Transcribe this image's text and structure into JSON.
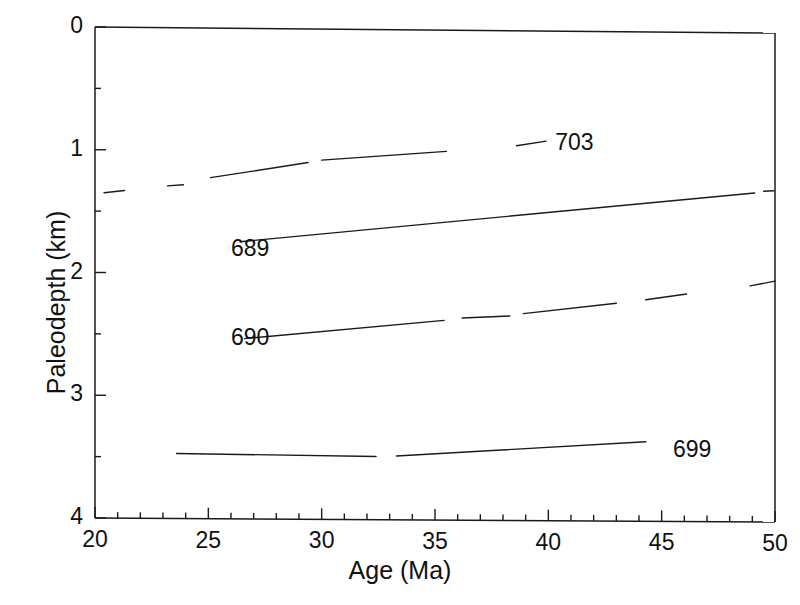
{
  "chart_data": {
    "type": "line",
    "title": "",
    "xlabel": "Age (Ma)",
    "ylabel": "Paleodepth (km)",
    "xlim": [
      20,
      50
    ],
    "ylim": [
      4,
      0
    ],
    "y_inverted": true,
    "grid": false,
    "legend": "inline-curve-labels",
    "xticks": [
      20,
      25,
      30,
      35,
      40,
      45,
      50
    ],
    "xtick_labels": [
      "20",
      "25",
      "30",
      "35",
      "40",
      "45",
      "50"
    ],
    "xminor_step": 1,
    "yticks": [
      0,
      1,
      2,
      3,
      4
    ],
    "ytick_labels": [
      "0",
      "1",
      "2",
      "3",
      "4"
    ],
    "yminor_step": 0.5,
    "series": [
      {
        "name": "703",
        "label": "703",
        "label_x": 40.3,
        "label_y": 0.93,
        "style": "dashed",
        "x": [
          20.4,
          21.3,
          23.2,
          23.9,
          25.1,
          26.1,
          28.3,
          29.4,
          32.8,
          34.3,
          35.5,
          38.6,
          39.9
        ],
        "y": [
          1.35,
          1.33,
          1.29,
          1.28,
          1.22,
          1.21,
          1.11,
          1.09,
          1.01,
          1.0,
          0.99,
          0.94,
          0.9
        ],
        "segments": [
          {
            "x": [
              20.4,
              21.3
            ],
            "y": [
              1.35,
              1.33
            ]
          },
          {
            "x": [
              23.2,
              23.9
            ],
            "y": [
              1.29,
              1.28
            ]
          },
          {
            "x": [
              25.1,
              29.4
            ],
            "y": [
              1.22,
              1.09
            ]
          },
          {
            "x": [
              30.0,
              35.5
            ],
            "y": [
              1.07,
              0.99
            ]
          },
          {
            "x": [
              38.6,
              39.9
            ],
            "y": [
              0.94,
              0.9
            ]
          }
        ]
      },
      {
        "name": "689",
        "label": "689",
        "label_x": 26.0,
        "label_y": 1.82,
        "style": "solid",
        "x": [
          26.4,
          28.0,
          30.0,
          32.0,
          34.0,
          36.0,
          38.0,
          40.0,
          42.0,
          44.0,
          46.0,
          48.0,
          49.1,
          49.9
        ],
        "y": [
          1.74,
          1.7,
          1.66,
          1.63,
          1.6,
          1.56,
          1.52,
          1.48,
          1.44,
          1.41,
          1.37,
          1.33,
          1.31,
          1.29
        ],
        "segments": [
          {
            "x": [
              26.4,
              49.1
            ],
            "y": [
              1.74,
              1.31
            ]
          },
          {
            "x": [
              49.5,
              49.95
            ],
            "y": [
              1.295,
              1.29
            ]
          }
        ]
      },
      {
        "name": "690",
        "label": "690",
        "label_x": 26.0,
        "label_y": 2.54,
        "style": "mixed",
        "x": [
          26.6,
          28.5,
          30.5,
          32.5,
          34.0,
          35.4,
          38.3,
          40.9,
          43.0,
          44.3,
          47.5,
          49.3,
          50.0
        ],
        "y": [
          2.53,
          2.49,
          2.45,
          2.42,
          2.4,
          2.37,
          2.33,
          2.27,
          2.22,
          2.19,
          2.12,
          2.06,
          2.03
        ],
        "segments": [
          {
            "x": [
              26.6,
              35.4
            ],
            "y": [
              2.53,
              2.37
            ]
          },
          {
            "x": [
              36.2,
              38.3
            ],
            "y": [
              2.35,
              2.33
            ]
          },
          {
            "x": [
              38.9,
              43.0
            ],
            "y": [
              2.31,
              2.22
            ]
          },
          {
            "x": [
              44.3,
              46.1
            ],
            "y": [
              2.19,
              2.14
            ]
          },
          {
            "x": [
              48.9,
              50.0
            ],
            "y": [
              2.07,
              2.03
            ]
          }
        ]
      },
      {
        "name": "699",
        "label": "699",
        "label_x": 45.5,
        "label_y": 3.43,
        "style": "solid",
        "x": [
          23.6,
          25.0,
          27.0,
          29.0,
          31.0,
          33.0,
          35.0,
          37.0,
          39.0,
          41.0,
          43.0,
          44.3
        ],
        "y": [
          3.47,
          3.48,
          3.48,
          3.49,
          3.48,
          3.48,
          3.47,
          3.46,
          3.43,
          3.4,
          3.37,
          3.35
        ],
        "segments": [
          {
            "x": [
              23.6,
              32.4
            ],
            "y": [
              3.47,
              3.485
            ]
          },
          {
            "x": [
              33.3,
              44.3
            ],
            "y": [
              3.48,
              3.35
            ]
          }
        ]
      }
    ]
  }
}
